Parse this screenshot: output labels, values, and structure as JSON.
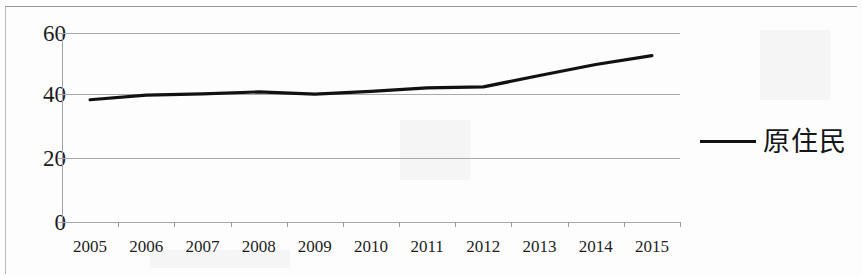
{
  "chart_data": {
    "type": "line",
    "title": "",
    "subtitle": "",
    "xlabel": "",
    "ylabel": "",
    "categories": [
      "2005",
      "2006",
      "2007",
      "2008",
      "2009",
      "2010",
      "2011",
      "2012",
      "2013",
      "2014",
      "2015"
    ],
    "x": [
      2005,
      2006,
      2007,
      2008,
      2009,
      2010,
      2011,
      2012,
      2013,
      2014,
      2015
    ],
    "series": [
      {
        "name": "原住民",
        "color": "#111111",
        "values": [
          38.8,
          40.3,
          40.7,
          41.3,
          40.6,
          41.5,
          42.6,
          42.9,
          46.5,
          50.0,
          52.8
        ]
      }
    ],
    "ylim": [
      0,
      60
    ],
    "yticks": [
      0,
      20,
      40,
      60
    ],
    "ytick_labels": [
      "0",
      "20",
      "40",
      "60"
    ],
    "xtick_labels": [
      "2005",
      "2006",
      "2007",
      "2008",
      "2009",
      "2010",
      "2011",
      "2012",
      "2013",
      "2014",
      "2015"
    ],
    "grid": true,
    "grid_axis": "y",
    "legend_position": "right",
    "legend_entries": [
      {
        "label": "原住民",
        "marker": "line",
        "color": "#111111"
      }
    ]
  },
  "axes": {
    "y": {
      "ticks": [
        {
          "label": "60",
          "value": 60
        },
        {
          "label": "40",
          "value": 40
        },
        {
          "label": "20",
          "value": 20
        },
        {
          "label": "0",
          "value": 0
        }
      ]
    },
    "x": {
      "ticks": [
        {
          "label": "2005"
        },
        {
          "label": "2006"
        },
        {
          "label": "2007"
        },
        {
          "label": "2008"
        },
        {
          "label": "2009"
        },
        {
          "label": "2010"
        },
        {
          "label": "2011"
        },
        {
          "label": "2012"
        },
        {
          "label": "2013"
        },
        {
          "label": "2014"
        },
        {
          "label": "2015"
        }
      ]
    }
  },
  "legend": {
    "label": "原住民",
    "color": "#111111"
  }
}
